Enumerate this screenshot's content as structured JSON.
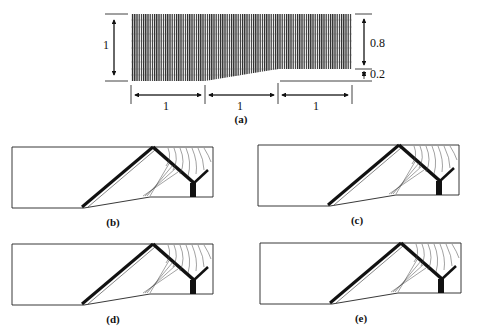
{
  "figure": {
    "panel_a": {
      "label": "(a)",
      "height_left": "1",
      "height_upper_right": "0.8",
      "height_lower_right": "0.2",
      "widths": [
        "1",
        "1",
        "1"
      ]
    },
    "panels": [
      {
        "label": "(b)"
      },
      {
        "label": "(c)"
      },
      {
        "label": "(d)"
      },
      {
        "label": "(e)"
      }
    ]
  }
}
